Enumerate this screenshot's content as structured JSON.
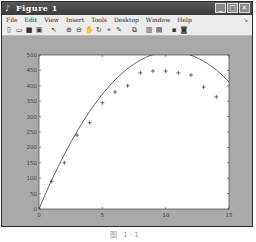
{
  "window": {
    "title": "Figure 1",
    "icon": "matlab-figure-icon",
    "controls": [
      "minimize",
      "maximize",
      "close"
    ]
  },
  "menubar": {
    "items": [
      "File",
      "Edit",
      "View",
      "Insert",
      "Tools",
      "Desktop",
      "Window",
      "Help"
    ],
    "overflow_arrow": "↘"
  },
  "toolbar": {
    "tools": [
      "new-figure",
      "open-file",
      "save",
      "print",
      "|",
      "edit-plot",
      "|",
      "zoom-in",
      "zoom-out",
      "pan",
      "rotate-3d",
      "data-cursor",
      "brush",
      "|",
      "link-plot",
      "|",
      "colorbar",
      "legend",
      "|",
      "hide-plot-tools",
      "show-plot-tools"
    ]
  },
  "caption": "图 1-1",
  "chart_data": {
    "type": "scatter",
    "title": "",
    "xlabel": "",
    "ylabel": "",
    "xlim": [
      0,
      15
    ],
    "ylim": [
      0,
      500
    ],
    "xticks": [
      0,
      5,
      10,
      15
    ],
    "yticks": [
      0,
      50,
      100,
      150,
      200,
      250,
      300,
      350,
      400,
      450,
      500
    ],
    "grid": false,
    "legend": null,
    "series": [
      {
        "name": "measured",
        "style": "markers",
        "marker": "+",
        "x": [
          1,
          2,
          3,
          4,
          5,
          6,
          7,
          8,
          9,
          10,
          11,
          12,
          13,
          14
        ],
        "values": [
          90,
          150,
          240,
          280,
          345,
          380,
          400,
          442,
          448,
          448,
          442,
          435,
          396,
          364
        ]
      },
      {
        "name": "fit",
        "style": "line",
        "equation": "y = 98*t - 4.7*t^2",
        "coefficients": {
          "a": 98,
          "b": -4.7
        },
        "x_range": [
          0,
          15
        ]
      }
    ]
  },
  "colors": {
    "figure_bg": "#a9a9a9",
    "axes_bg": "#ffffff",
    "line": "#333333",
    "titlebar": "#4a4a4a"
  }
}
